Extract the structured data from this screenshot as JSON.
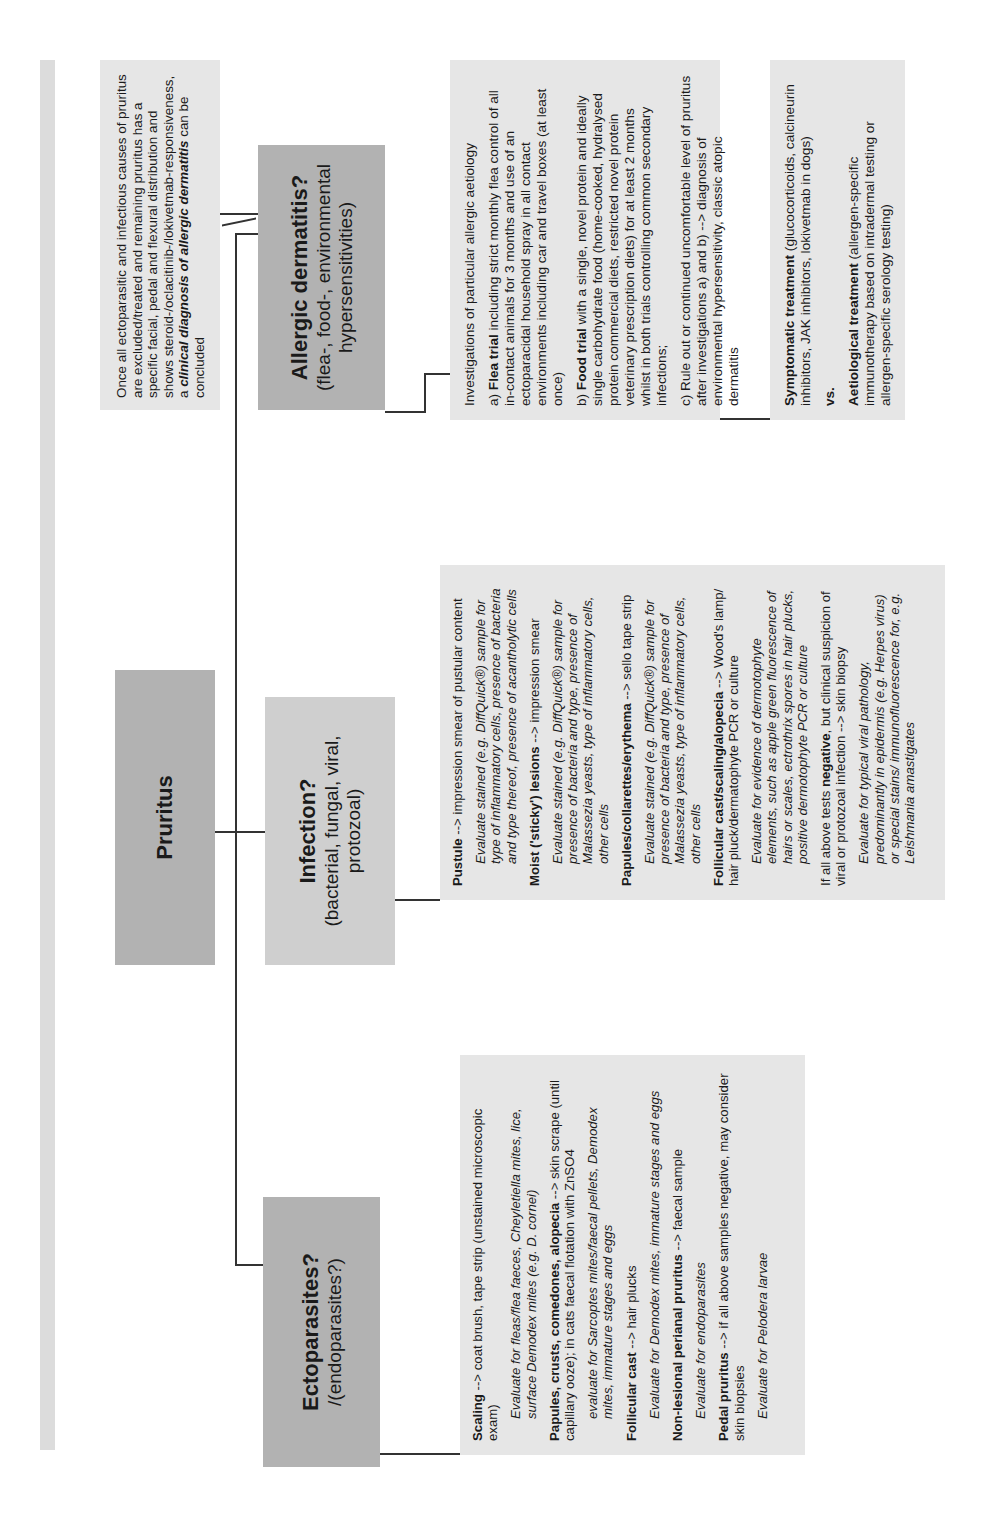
{
  "root": {
    "title": "Pruritus"
  },
  "branches": {
    "ectoparasites": {
      "title": "Ectoparasites?",
      "subtitle": "/(endoparasites?)"
    },
    "infection": {
      "title": "Infection?",
      "subtitle": "(bacterial, fungal, viral, protozoal)"
    },
    "allergic": {
      "title": "Allergic dermatitis?",
      "subtitle": "(flea-, food-, environmental hypersensitivities)"
    }
  },
  "conclusion": {
    "text_pre": "Once all ectoparasitic and infectious causes of pruritus are excluded/treated and remaining pruritus has a specific facial, pedal and flexural distribution and shows steroid-/oclacitinib-/lokivetmab-responsiveness, a ",
    "text_emph": "clinical diagnosis of allergic dermatitis",
    "text_post": " can be concluded"
  },
  "ecto_detail": {
    "items": [
      {
        "bold": "Scaling",
        "rest": " --> coat brush, tape strip (unstained microscopic exam)",
        "note": "Evaluate for fleas/flea faeces, Cheyletiella mites, lice, surface Demodex mites (e.g. D. cornei)"
      },
      {
        "bold": "Papules, crusts, comedones, alopecia",
        "rest": " --> skin scrape (until capillary ooze); in cats faecal flotation with ZnSO4",
        "note": "evaluate for Sarcoptes mites/faecal pellets, Demodex mites, immature stages and eggs"
      },
      {
        "bold": "Follicular cast",
        "rest": " --> hair plucks",
        "note": "Evaluate for Demodex mites, immature stages and eggs"
      },
      {
        "bold": "Non-lesional perianal pruritus",
        "rest": " --> faecal sample",
        "note": "Evaluate for endoparasites"
      },
      {
        "bold": "Pedal pruritus",
        "rest": " --> if all above samples negative, may consider skin biopsies",
        "note": "Evaluate for Pelodera larvae"
      }
    ]
  },
  "infection_detail": {
    "items": [
      {
        "bold": "Pustule",
        "rest": " --> impression smear of pustular content",
        "note": "Evaluate stained (e.g. DiffQuick®) sample for type of inflammatory cells, presence of bacteria and type thereof, presence of acantholytic cells"
      },
      {
        "bold": "Moist ('sticky') lesions",
        "rest": " --> impression smear",
        "note": "Evaluate stained (e.g. DiffQuick®) sample for presence of bacteria and type, presence of Malassezia yeasts, type of inflammatory cells, other cells"
      },
      {
        "bold": "Papules/collarettes/erythema",
        "rest": " --> sello tape strip",
        "note": "Evaluate stained (e.g. DiffQuick®) sample for presence of bacteria and type, presence of Malassezia yeasts, type of inflammatory cells, other cells"
      },
      {
        "bold": "Follicular cast/scaling/alopecia",
        "rest": " --> Wood's lamp/ hair pluck/dermatophyte PCR or culture",
        "note": "Evaluate for evidence of dermotophyte elements, such as apple green fluorescence of hairs or scales, ectrothrix spores in hair plucks, positive dermotophyte PCR or culture"
      },
      {
        "pre": "If all above tests ",
        "bold": "negative",
        "rest": ", but clinical suspicion of viral or protozoal infection --> skin biopsy",
        "note": "Evaluate for typical viral pathology, predominantly in epidermis (e.g. Herpes virus) or special stains/ immunofluorescence for, e.g. Leishmania amastigates"
      }
    ]
  },
  "allergic_detail": {
    "intro": "Investigations of particular allergic aetiology",
    "a": {
      "pre": "a) ",
      "bold": "Flea trial",
      "rest": " including strict monthly flea control of all in-contact animals for 3 months and use of an ectoparacidal household spray in all contact environments including car and travel boxes (at least once)"
    },
    "b": {
      "pre": "b) ",
      "bold": "Food trial",
      "rest": " with a single, novel protein and ideally single carbohydrate food (home-cooked, hydralysed protein commercial diets, restricted novel protein veterinary prescription diets) for at least 2 months whilst in both trials controlling common secondary infections;"
    },
    "c": {
      "text": "c) Rule out or continued uncomfortable level of pruritus after investigations a) and b) --> diagnosis of environmental hypersensitivity, classic atopic dermatitis"
    }
  },
  "treatment": {
    "symptomatic": {
      "bold": "Symptomatic treatment",
      "rest": " (glucocorticoids, calcineurin inhibitors, JAK inhibitors, lokivetmab in dogs)"
    },
    "vs": "vs.",
    "aetiological": {
      "bold": "Aetiological treatment",
      "rest": " (allergen-specific immunotherapy based on intradermal testing or allergen-specific serology testing)"
    }
  },
  "colors": {
    "header_dark": "#b2b2b2",
    "header_light": "#cfcfcf",
    "detail_bg": "#e6e6e6",
    "line": "#333333"
  }
}
